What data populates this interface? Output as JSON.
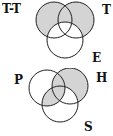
{
  "diagrams": [
    {
      "id": "top",
      "labels": {
        "top_left": "T-T",
        "top_right": "T",
        "bottom": "E"
      },
      "shaded_regions": [
        "A only",
        "B only",
        "A∩B not C"
      ],
      "shade_color": "#d4d4d4"
    },
    {
      "id": "bottom",
      "labels": {
        "left": "P",
        "right": "H",
        "bottom": "S"
      },
      "shaded_regions": [
        "H only",
        "P∩H not S",
        "P∩S not H",
        "P∩H∩S"
      ],
      "shade_color": "#d4d4d4"
    }
  ],
  "colors": {
    "stroke": "#222222",
    "shade": "#d4d4d4",
    "background": "#ffffff"
  }
}
